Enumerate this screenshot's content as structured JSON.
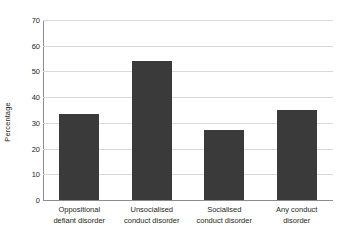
{
  "chart_data": {
    "type": "bar",
    "title": "",
    "xlabel": "",
    "ylabel": "Percentage",
    "ylim": [
      0,
      70
    ],
    "yticks": [
      70,
      60,
      50,
      40,
      30,
      20,
      10,
      0
    ],
    "grid": true,
    "legend": "none",
    "bar_color": "#3a3a3a",
    "grid_color": "#d9d9d9",
    "axis_color": "#8c8c8c",
    "background": "#ffffff",
    "categories": [
      "Oppositional defiant disorder",
      "Unsocialised conduct disorder",
      "Socialised conduct disorder",
      "Any conduct disorder"
    ],
    "category_lines": [
      [
        "Oppositional",
        "defiant disorder"
      ],
      [
        "Unsocialised",
        "conduct disorder"
      ],
      [
        "Socialised",
        "conduct disorder"
      ],
      [
        "Any conduct",
        "disorder"
      ]
    ],
    "values": [
      33.3,
      54.2,
      27.2,
      35.2
    ]
  }
}
